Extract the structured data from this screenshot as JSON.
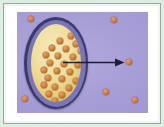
{
  "figure": {
    "frame": {
      "outer_background_color": "#dfeee2",
      "mat_color": "#ffffff",
      "rule_color": "#9aa59c"
    },
    "panel": {
      "background_color": "#a79ed6",
      "label": "extracellular-space"
    },
    "cell": {
      "label": "cell",
      "membrane_color": "#3a3a6e",
      "membrane_inner_color": "#7b76b4",
      "cytoplasm_color": "#f1dfa2",
      "shape": "oval"
    },
    "particle": {
      "label": "solute-particle",
      "color": "#d08038",
      "outline_color": "#9a5a22"
    },
    "arrow": {
      "label": "transport-direction-arrow",
      "color": "#1d1d3c",
      "direction": "right-outward"
    }
  },
  "chart_data": {
    "type": "scatter",
    "xlabel": "",
    "ylabel": "",
    "xlim": [
      0,
      131
    ],
    "ylim": [
      0,
      101
    ],
    "grid": false,
    "legend": "none",
    "annotations": [
      {
        "name": "transport-arrow",
        "type": "arrow",
        "x0": 46,
        "y0": 50,
        "x1": 108,
        "y1": 50,
        "color": "#1d1d3c"
      },
      {
        "name": "cell-boundary",
        "type": "ellipse",
        "cx": 39,
        "cy": 51,
        "rx": 32,
        "ry": 46,
        "fill": "#f1dfa2",
        "stroke": "#3a3a6e"
      }
    ],
    "series": [
      {
        "name": "intracellular-particles",
        "color": "#d08038",
        "points": [
          {
            "x": 40,
            "y": 12,
            "r": 2.6
          },
          {
            "x": 50,
            "y": 14,
            "r": 2.6
          },
          {
            "x": 29,
            "y": 17,
            "r": 2.6
          },
          {
            "x": 45,
            "y": 20,
            "r": 2.6
          },
          {
            "x": 57,
            "y": 20,
            "r": 2.6
          },
          {
            "x": 21,
            "y": 24,
            "r": 2.6
          },
          {
            "x": 35,
            "y": 25,
            "r": 2.6
          },
          {
            "x": 50,
            "y": 27,
            "r": 2.6
          },
          {
            "x": 61,
            "y": 28,
            "r": 2.6
          },
          {
            "x": 15,
            "y": 31,
            "r": 2.6
          },
          {
            "x": 27,
            "y": 32,
            "r": 2.6
          },
          {
            "x": 42,
            "y": 33,
            "r": 2.6
          },
          {
            "x": 55,
            "y": 35,
            "r": 2.6
          },
          {
            "x": 19,
            "y": 39,
            "r": 2.6
          },
          {
            "x": 33,
            "y": 40,
            "r": 2.6
          },
          {
            "x": 47,
            "y": 41,
            "r": 2.6
          },
          {
            "x": 62,
            "y": 41,
            "r": 2.6
          },
          {
            "x": 13,
            "y": 46,
            "r": 2.6
          },
          {
            "x": 26,
            "y": 47,
            "r": 2.6
          },
          {
            "x": 39,
            "y": 48,
            "r": 2.6
          },
          {
            "x": 57,
            "y": 50,
            "r": 2.6
          },
          {
            "x": 17,
            "y": 54,
            "r": 2.6
          },
          {
            "x": 31,
            "y": 55,
            "r": 2.6
          },
          {
            "x": 45,
            "y": 57,
            "r": 2.6
          },
          {
            "x": 60,
            "y": 57,
            "r": 2.6
          },
          {
            "x": 13,
            "y": 61,
            "r": 2.6
          },
          {
            "x": 24,
            "y": 63,
            "r": 2.6
          },
          {
            "x": 38,
            "y": 64,
            "r": 2.6
          },
          {
            "x": 52,
            "y": 64,
            "r": 2.6
          },
          {
            "x": 18,
            "y": 70,
            "r": 2.6
          },
          {
            "x": 31,
            "y": 71,
            "r": 2.6
          },
          {
            "x": 45,
            "y": 72,
            "r": 2.6
          },
          {
            "x": 58,
            "y": 70,
            "r": 2.6
          },
          {
            "x": 24,
            "y": 77,
            "r": 2.6
          },
          {
            "x": 38,
            "y": 79,
            "r": 2.6
          },
          {
            "x": 51,
            "y": 77,
            "r": 2.6
          },
          {
            "x": 31,
            "y": 84,
            "r": 2.6
          },
          {
            "x": 44,
            "y": 85,
            "r": 2.6
          }
        ]
      },
      {
        "name": "extracellular-particles",
        "color": "#cf7c41",
        "points": [
          {
            "x": 14,
            "y": 7,
            "r": 2.8
          },
          {
            "x": 97,
            "y": 8,
            "r": 2.8
          },
          {
            "x": 112,
            "y": 50,
            "r": 2.8
          },
          {
            "x": 8,
            "y": 87,
            "r": 2.8
          },
          {
            "x": 89,
            "y": 80,
            "r": 2.8
          },
          {
            "x": 118,
            "y": 88,
            "r": 2.8
          }
        ]
      }
    ]
  }
}
